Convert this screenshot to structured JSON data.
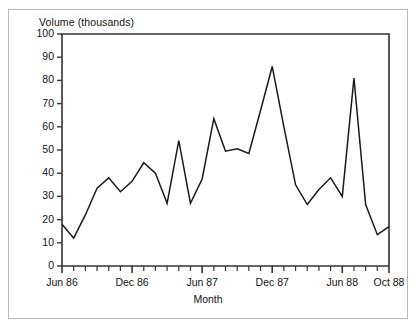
{
  "figure": {
    "ylabel": "Volume (thousands)",
    "xlabel": "Month",
    "border_color": "#b9b9b9",
    "line_color": "#1a1a1a",
    "axis_color": "#333333"
  },
  "chart_data": {
    "type": "line",
    "title": "",
    "xlabel": "Month",
    "ylabel": "Volume (thousands)",
    "ylim": [
      0,
      100
    ],
    "ytick_labels": [
      "0",
      "10",
      "20",
      "30",
      "40",
      "50",
      "60",
      "70",
      "80",
      "90",
      "100"
    ],
    "ytick_values": [
      0,
      10,
      20,
      30,
      40,
      50,
      60,
      70,
      80,
      90,
      100
    ],
    "xtick_labels": [
      "Jun 86",
      "Dec 86",
      "Jun 87",
      "Dec 87",
      "Jun 88",
      "Oct 88"
    ],
    "xtick_indices": [
      0,
      6,
      12,
      18,
      24,
      28
    ],
    "grid": false,
    "legend": false,
    "minor_xticks": true,
    "x": [
      "Jun 86",
      "Jul 86",
      "Aug 86",
      "Sep 86",
      "Oct 86",
      "Nov 86",
      "Dec 86",
      "Jan 87",
      "Feb 87",
      "Mar 87",
      "Apr 87",
      "May 87",
      "Jun 87",
      "Jul 87",
      "Aug 87",
      "Sep 87",
      "Oct 87",
      "Nov 87",
      "Dec 87",
      "Jan 88",
      "Feb 88",
      "Mar 88",
      "Apr 88",
      "May 88",
      "Jun 88",
      "Jul 88",
      "Aug 88",
      "Sep 88",
      "Oct 88"
    ],
    "values": [
      18,
      12,
      22,
      33.5,
      38,
      32,
      36.5,
      44.5,
      40,
      27,
      54,
      27,
      37.5,
      63.5,
      49.5,
      50.5,
      48.5,
      67,
      86,
      60,
      35,
      26.5,
      33,
      38,
      30,
      81,
      26.5,
      13.5,
      17
    ],
    "series": [
      {
        "name": "Volume",
        "values": [
          18,
          12,
          22,
          33.5,
          38,
          32,
          36.5,
          44.5,
          40,
          27,
          54,
          27,
          37.5,
          63.5,
          49.5,
          50.5,
          48.5,
          67,
          86,
          60,
          35,
          26.5,
          33,
          38,
          30,
          81,
          26.5,
          13.5,
          17
        ]
      }
    ]
  }
}
